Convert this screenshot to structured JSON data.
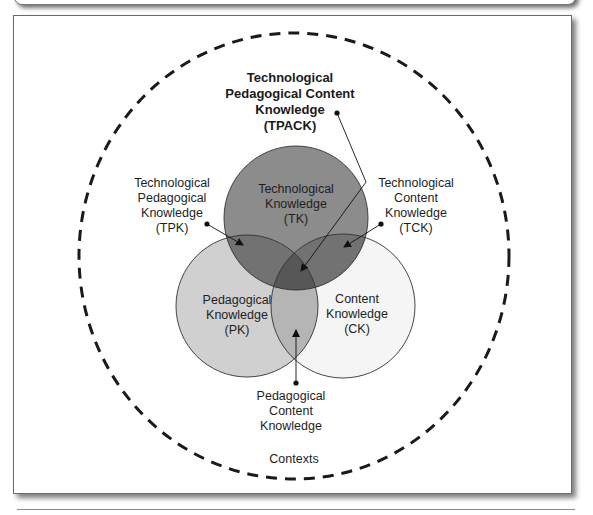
{
  "diagram": {
    "type": "venn",
    "colors": {
      "tk": "#8c8c8c",
      "pk": "#d0d0d0",
      "ck": "#f5f5f5",
      "tk_pk": "#727272",
      "tk_ck": "#727272",
      "pk_ck": "#b5b5b5",
      "tpack": "#575757",
      "context_border": "#1a1a1a"
    },
    "sets": {
      "tk": {
        "line1": "Technological",
        "line2": "Knowledge",
        "line3": "(TK)"
      },
      "pk": {
        "line1": "Pedagogical",
        "line2": "Knowledge",
        "line3": "(PK)"
      },
      "ck": {
        "line1": "Content",
        "line2": "Knowledge",
        "line3": "(CK)"
      }
    },
    "intersections": {
      "tpack": {
        "line1": "Technological",
        "line2": "Pedagogical Content",
        "line3": "Knowledge",
        "line4": "(TPACK)"
      },
      "tpk": {
        "line1": "Technological",
        "line2": "Pedagogical",
        "line3": "Knowledge",
        "line4": "(TPK)"
      },
      "tck": {
        "line1": "Technological",
        "line2": "Content",
        "line3": "Knowledge",
        "line4": "(TCK)"
      },
      "pck": {
        "line1": "Pedagogical",
        "line2": "Content",
        "line3": "Knowledge"
      }
    },
    "context": {
      "label": "Contexts"
    }
  }
}
